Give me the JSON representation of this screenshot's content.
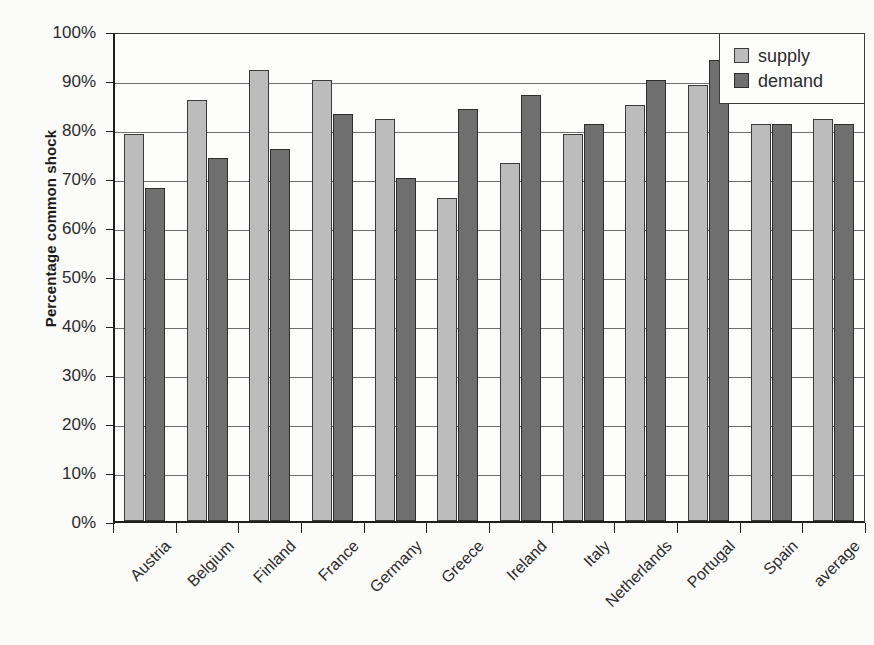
{
  "chart_data": {
    "type": "bar",
    "title": "",
    "xlabel": "",
    "ylabel": "Percentage common shock",
    "ylim": [
      0,
      100
    ],
    "y_tick_labels": [
      "100%",
      "90%",
      "80%",
      "70%",
      "60%",
      "50%",
      "40%",
      "30%",
      "20%",
      "10%",
      "0%"
    ],
    "y_ticks": [
      100,
      90,
      80,
      70,
      60,
      50,
      40,
      30,
      20,
      10,
      0
    ],
    "grid": true,
    "legend_position": "top-right",
    "categories": [
      "Austria",
      "Belgium",
      "Finland",
      "France",
      "Germany",
      "Greece",
      "Ireland",
      "Italy",
      "Netherlands",
      "Portugal",
      "Spain",
      "average"
    ],
    "series": [
      {
        "name": "supply",
        "color": "#bcbcbc",
        "values": [
          79,
          86,
          92,
          90,
          82,
          66,
          73,
          79,
          85,
          89,
          81,
          82
        ]
      },
      {
        "name": "demand",
        "color": "#6f6f6f",
        "values": [
          68,
          74,
          76,
          83,
          70,
          84,
          87,
          81,
          90,
          94,
          81,
          81
        ]
      }
    ]
  },
  "legend": {
    "items": [
      {
        "label": "supply"
      },
      {
        "label": "demand"
      }
    ]
  }
}
